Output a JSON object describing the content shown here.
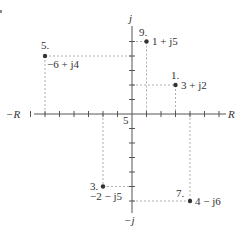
{
  "diagram": {
    "type": "complex-plane",
    "axes": {
      "horizontal_positive_label": "R",
      "horizontal_negative_label": "−R",
      "vertical_positive_label": "j",
      "vertical_negative_label": "−j",
      "tick_label": "5",
      "range": [
        -7,
        7
      ]
    },
    "points": [
      {
        "id": "1.",
        "value": "3 + j2",
        "re": 3,
        "im": 2
      },
      {
        "id": "3.",
        "value": "−2 − j5",
        "re": -2,
        "im": -5
      },
      {
        "id": "5.",
        "value": "−6 + j4",
        "re": -6,
        "im": 4
      },
      {
        "id": "7.",
        "value": "4 − j6",
        "re": 4,
        "im": -6
      },
      {
        "id": "9.",
        "value": "1 + j5",
        "re": 1,
        "im": 5
      }
    ],
    "colors": {
      "axis": "#555555",
      "point": "#333333",
      "guide": "#999999",
      "text": "#333333"
    }
  }
}
